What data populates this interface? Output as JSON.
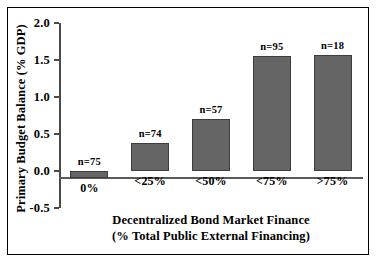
{
  "chart_data": {
    "type": "bar",
    "title": "",
    "xlabel": "Decentralized Bond Market Finance",
    "xlabel_sub": "(% Total Public External Financing)",
    "ylabel": "Primary Budget Balance (% GDP)",
    "categories": [
      "0%",
      "<25%",
      "<50%",
      "<75%",
      ">75%"
    ],
    "values": [
      -0.1,
      0.38,
      0.7,
      1.55,
      1.57
    ],
    "point_labels": [
      "n=75",
      "n=74",
      "n=57",
      "n=95",
      "n=18"
    ],
    "counts": [
      75,
      74,
      57,
      95,
      18
    ],
    "ylim": [
      -0.5,
      2.0
    ],
    "yticks": [
      "2.0",
      "1.5",
      "1.0",
      "0.5",
      "0.0",
      "-0.5"
    ],
    "ytick_values": [
      2.0,
      1.5,
      1.0,
      0.5,
      0.0,
      -0.5
    ],
    "grid": false,
    "legend": "none",
    "bar_color": "#656565",
    "bar_edge_color": "#3d3d3d",
    "axis_color": "#4a4a4a",
    "frame_color": "#000000",
    "background_color": "#ffffff"
  }
}
